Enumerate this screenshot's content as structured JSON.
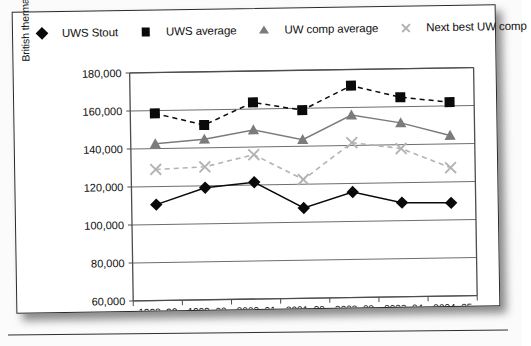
{
  "chart_data": {
    "type": "line",
    "title": "",
    "xlabel": "",
    "ylabel": "British thermal unit/gross square feet/year",
    "categories": [
      "1998–99",
      "1999–00",
      "2000–01",
      "2001–02",
      "2002–03",
      "2003–04",
      "2004–05"
    ],
    "ylim": [
      60000,
      180000
    ],
    "yticks": [
      60000,
      80000,
      100000,
      120000,
      140000,
      160000,
      180000
    ],
    "ytick_labels": [
      "60,000",
      "80,000",
      "100,000",
      "120,000",
      "140,000",
      "160,000",
      "180,000"
    ],
    "grid": true,
    "legend_position": "top",
    "series": [
      {
        "name": "UWS Stout",
        "marker": "diamond",
        "line_style": "solid",
        "color": "#0a0a0a",
        "values": [
          110500,
          119000,
          121500,
          107500,
          115500,
          109500,
          109000
        ]
      },
      {
        "name": "UWS average",
        "marker": "square",
        "line_style": "dashed",
        "color": "#0a0a0a",
        "values": [
          158500,
          152000,
          163500,
          159000,
          171500,
          165000,
          162000
        ]
      },
      {
        "name": "UW comp average",
        "marker": "triangle",
        "line_style": "solid",
        "color": "#7b7b7b",
        "values": [
          142500,
          144500,
          149000,
          143500,
          156000,
          151500,
          144500
        ]
      },
      {
        "name": "Next best UW comp",
        "marker": "cross",
        "line_style": "dashed",
        "color": "#b3b3b3",
        "values": [
          129000,
          130000,
          136000,
          122500,
          141500,
          138000,
          127500
        ]
      }
    ]
  },
  "legend": {
    "items": [
      {
        "label": "UWS Stout",
        "marker": "diamond-marker",
        "line": "solid"
      },
      {
        "label": "UWS average",
        "marker": "square-marker",
        "line": "dashed"
      },
      {
        "label": "UW comp average",
        "marker": "triangle-marker",
        "line": "solid"
      },
      {
        "label": "Next best UW comp",
        "marker": "cross-marker",
        "line": "dashed"
      }
    ]
  },
  "colors": {
    "series_dark": "#0a0a0a",
    "series_mid_gray": "#7b7b7b",
    "series_light_gray": "#b3b3b3",
    "axis": "#4d4d4d",
    "page_border": "#2a2a2a"
  }
}
